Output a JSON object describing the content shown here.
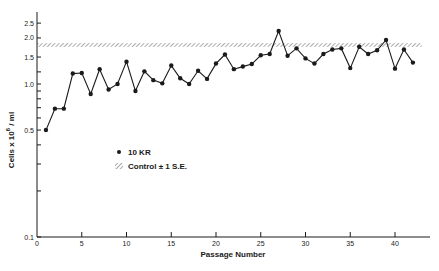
{
  "chart_data": {
    "type": "line",
    "title": "",
    "xlabel": "Passage Number",
    "ylabel": "Cells x 10⁶ / ml",
    "yscale": "log",
    "xlim": [
      0,
      44
    ],
    "ylim": [
      0.1,
      3.0
    ],
    "xticks": [
      0,
      5,
      10,
      15,
      20,
      25,
      30,
      35,
      40
    ],
    "yticks_labeled": [
      0.1,
      0.5,
      1.0,
      1.5,
      2.0,
      2.5
    ],
    "ytick_labels": [
      "0.1",
      "0.5",
      "1.0",
      "1.5",
      "2.0",
      "2.5"
    ],
    "yticks_minor": [
      0.2,
      0.3,
      0.4,
      0.6,
      0.7,
      0.8,
      0.9,
      1.2
    ],
    "grid": false,
    "legend_position": "inside-left-middle",
    "series": [
      {
        "name": "10 KR",
        "marker": "filled-circle",
        "color": "#1a1a1a",
        "x": [
          1,
          2,
          3,
          4,
          5,
          6,
          7,
          8,
          9,
          10,
          11,
          12,
          13,
          14,
          15,
          16,
          17,
          18,
          19,
          20,
          21,
          22,
          23,
          24,
          25,
          26,
          27,
          28,
          29,
          30,
          31,
          32,
          33,
          34,
          35,
          36,
          37,
          38,
          39,
          40,
          41,
          42
        ],
        "values": [
          0.5,
          0.69,
          0.69,
          1.17,
          1.18,
          0.86,
          1.25,
          0.92,
          1.0,
          1.4,
          0.9,
          1.21,
          1.06,
          1.01,
          1.32,
          1.09,
          1.0,
          1.22,
          1.08,
          1.36,
          1.56,
          1.25,
          1.3,
          1.35,
          1.54,
          1.57,
          2.22,
          1.53,
          1.71,
          1.47,
          1.36,
          1.57,
          1.68,
          1.71,
          1.27,
          1.75,
          1.57,
          1.66,
          1.94,
          1.26,
          1.68,
          1.38
        ]
      }
    ],
    "bands": [
      {
        "name": "Control ± 1 S.E.",
        "pattern": "hatched",
        "y_low": 1.75,
        "y_high": 1.85,
        "x_start": 0,
        "x_end": 43
      }
    ]
  },
  "legend": {
    "series_label": "10 KR",
    "band_label": "Control ± 1 S.E."
  },
  "axes": {
    "xlabel": "Passage Number",
    "ylabel_main": "Cells  x  10",
    "ylabel_sup": "6",
    "ylabel_tail": " / ml"
  }
}
